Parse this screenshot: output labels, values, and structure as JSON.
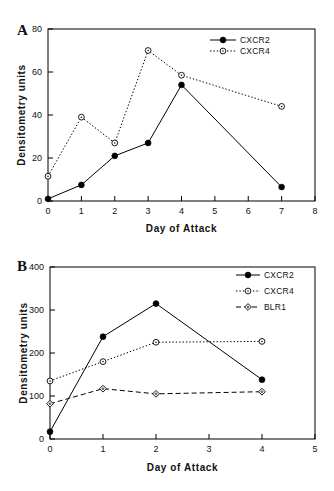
{
  "figure": {
    "axis_title_x": "Day of Attack",
    "axis_title_y": "Densitometry units",
    "panel_a_letter": "A",
    "panel_b_letter": "B"
  },
  "chart_data": [
    {
      "panel": "A",
      "type": "line",
      "title": "",
      "xlabel": "Day of Attack",
      "ylabel": "Densitometry units",
      "xlim": [
        0,
        8
      ],
      "ylim": [
        0,
        80
      ],
      "xticks": [
        0,
        1,
        2,
        3,
        4,
        5,
        6,
        7,
        8
      ],
      "xtick_labels": [
        "0",
        "1",
        "2",
        "3",
        "4",
        "5",
        "6",
        "7",
        "8"
      ],
      "yticks": [
        0,
        20,
        40,
        60,
        80
      ],
      "ytick_labels": [
        "0",
        "20",
        "40",
        "60",
        "80"
      ],
      "grid": false,
      "legend_position": "top-right",
      "x": [
        0,
        1,
        2,
        3,
        4,
        7
      ],
      "series": [
        {
          "name": "CXCR2",
          "values": [
            1,
            7.5,
            21,
            27,
            54,
            6.5
          ],
          "line_style": "solid",
          "marker": "filled-circle",
          "color": "#000000"
        },
        {
          "name": "CXCR4",
          "values": [
            11.5,
            39,
            27,
            70,
            58.5,
            44
          ],
          "line_style": "dotted",
          "marker": "open-circle",
          "color": "#000000"
        }
      ]
    },
    {
      "panel": "B",
      "type": "line",
      "title": "",
      "xlabel": "Day of Attack",
      "ylabel": "Densitometry units",
      "xlim": [
        0,
        5
      ],
      "ylim": [
        0,
        400
      ],
      "xticks": [
        0,
        1,
        2,
        3,
        4,
        5
      ],
      "xtick_labels": [
        "0",
        "1",
        "2",
        "3",
        "4",
        "5"
      ],
      "yticks": [
        0,
        100,
        200,
        300,
        400
      ],
      "ytick_labels": [
        "0",
        "100",
        "200",
        "300",
        "400"
      ],
      "grid": false,
      "legend_position": "top-right",
      "x": [
        0,
        1,
        2,
        4
      ],
      "series": [
        {
          "name": "CXCR2",
          "values": [
            17,
            238,
            315,
            138
          ],
          "line_style": "solid",
          "marker": "filled-circle",
          "color": "#000000"
        },
        {
          "name": "CXCR4",
          "values": [
            135,
            180,
            225,
            227
          ],
          "line_style": "dotted",
          "marker": "open-circle",
          "color": "#000000"
        },
        {
          "name": "BLR1",
          "values": [
            82,
            117,
            105,
            110
          ],
          "line_style": "dashed",
          "marker": "open-diamond",
          "color": "#000000"
        }
      ]
    }
  ]
}
